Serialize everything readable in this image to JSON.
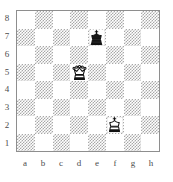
{
  "figure": {
    "kind": "chess-diagram",
    "orientation": "white-bottom"
  },
  "board": {
    "files": [
      "a",
      "b",
      "c",
      "d",
      "e",
      "f",
      "g",
      "h"
    ],
    "ranks": [
      "8",
      "7",
      "6",
      "5",
      "4",
      "3",
      "2",
      "1"
    ],
    "light_square_color": "#ffffff",
    "dark_square_color": "#a8a8a8",
    "border_color": "#8e8e8e",
    "label_color": "#4c4c4c",
    "squares": [
      [
        "light",
        "dark",
        "light",
        "dark",
        "light",
        "dark",
        "light",
        "dark"
      ],
      [
        "dark",
        "light",
        "dark",
        "light",
        "dark",
        "light",
        "dark",
        "light"
      ],
      [
        "light",
        "dark",
        "light",
        "dark",
        "light",
        "dark",
        "light",
        "dark"
      ],
      [
        "dark",
        "light",
        "dark",
        "light",
        "dark",
        "light",
        "dark",
        "light"
      ],
      [
        "light",
        "dark",
        "light",
        "dark",
        "light",
        "dark",
        "light",
        "dark"
      ],
      [
        "dark",
        "light",
        "dark",
        "light",
        "dark",
        "light",
        "dark",
        "light"
      ],
      [
        "light",
        "dark",
        "light",
        "dark",
        "light",
        "dark",
        "light",
        "dark"
      ],
      [
        "dark",
        "light",
        "dark",
        "light",
        "dark",
        "light",
        "dark",
        "light"
      ]
    ]
  },
  "pieces": [
    {
      "square": "e7",
      "color": "black",
      "type": "king",
      "glyph": "black-king-icon",
      "row": 1,
      "col": 4
    },
    {
      "square": "d5",
      "color": "white",
      "type": "queen",
      "glyph": "white-queen-icon",
      "row": 3,
      "col": 3
    },
    {
      "square": "f2",
      "color": "white",
      "type": "king",
      "glyph": "white-king-icon",
      "row": 6,
      "col": 5
    }
  ]
}
